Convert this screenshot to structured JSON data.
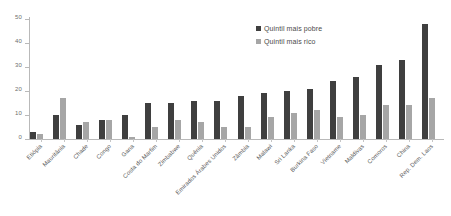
{
  "chart_data": {
    "type": "bar",
    "title": "",
    "xlabel": "",
    "ylabel": "",
    "ylim": [
      0,
      50
    ],
    "yticks": [
      0,
      10,
      20,
      30,
      40,
      50
    ],
    "grid": false,
    "legend_position": "top-right",
    "categories": [
      "Etiópia",
      "Mauritânia",
      "Chade",
      "Congo",
      "Gana",
      "Costa do Marfim",
      "Zimbabwe",
      "Quênia",
      "Emirados Árabes Unidos",
      "Zâmbia",
      "Malawi",
      "Sri Lanka",
      "Burkina Faso",
      "Vietname",
      "Maldivas",
      "Comoros",
      "China",
      "Rep. Dem. Laos"
    ],
    "series": [
      {
        "name": "Quintil mais pobre",
        "color": "#3f3f3f",
        "values": [
          3,
          10,
          6,
          8,
          10,
          15,
          15,
          16,
          16,
          18,
          19,
          20,
          21,
          24,
          26,
          31,
          33,
          48
        ]
      },
      {
        "name": "Quintil mais rico",
        "color": "#a6a6a6",
        "values": [
          2,
          17,
          7,
          8,
          1,
          5,
          8,
          7,
          5,
          5,
          9,
          11,
          12,
          9,
          10,
          14,
          14,
          17
        ]
      }
    ]
  },
  "legend": {
    "items": [
      {
        "label": "Quintil mais pobre",
        "color": "#3f3f3f"
      },
      {
        "label": "Quintil mais rico",
        "color": "#a6a6a6"
      }
    ]
  },
  "axis": {
    "y_tick_labels": [
      "0",
      "10",
      "20",
      "30",
      "40",
      "50"
    ]
  }
}
